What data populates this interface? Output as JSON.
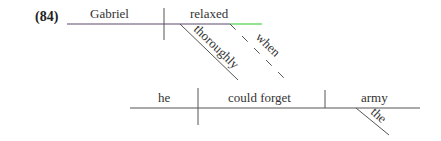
{
  "example_number": "(84)",
  "clause_main": {
    "subject": "Gabriel",
    "verb": "relaxed",
    "modifiers": [
      "thoroughly"
    ],
    "connector": "when"
  },
  "clause_sub": {
    "subject": "he",
    "verb": "could forget",
    "object": "army",
    "object_modifier": "the"
  },
  "colors": {
    "main_line": "#5a4a6a",
    "highlight_line": "#4cd44c",
    "text": "#333333",
    "line": "#555555"
  }
}
